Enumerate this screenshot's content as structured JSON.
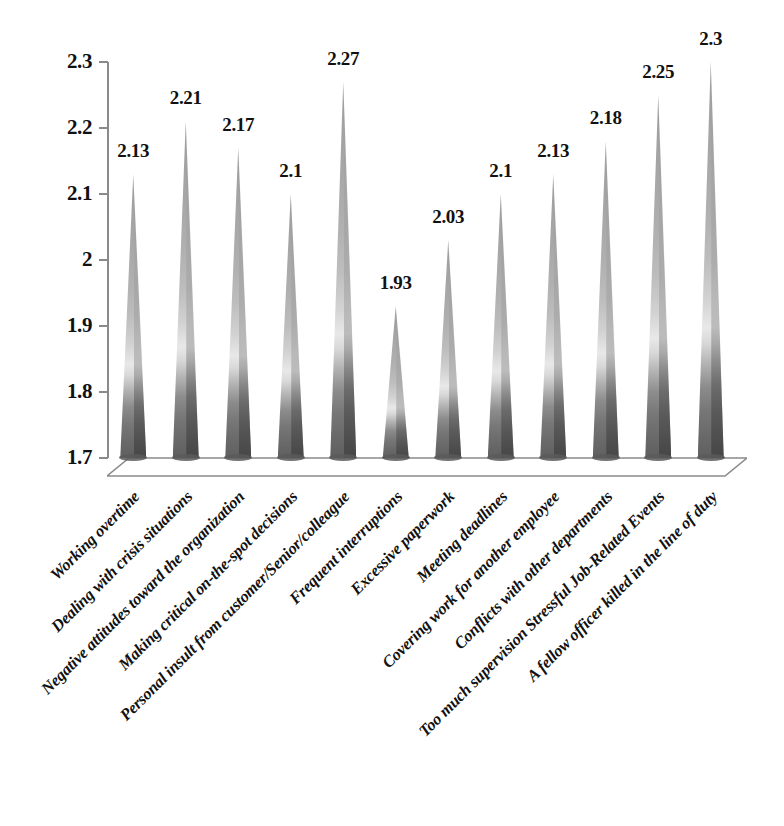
{
  "chart_data": {
    "type": "bar",
    "title": "",
    "subtitle": "",
    "xlabel": "",
    "ylabel": "",
    "ylim": [
      1.7,
      2.3
    ],
    "ytick_step": 0.1,
    "grid": false,
    "legend": "none",
    "bar_shape": "cone-3d",
    "categories": [
      "Working overtime",
      "Dealing with crisis situations",
      "Negative attitudes toward the organization",
      "Making critical on-the-spot decisions",
      "Personal insult from customer/Senior/colleague",
      "Frequent interruptions",
      "Excessive paperwork",
      "Meeting deadlines",
      "Covering work for another employee",
      "Conflicts with other departments",
      "Too much supervision Stressful Job-Related Events",
      "A fellow officer killed in the line of duty"
    ],
    "values": [
      2.13,
      2.21,
      2.17,
      2.1,
      2.27,
      1.93,
      2.03,
      2.1,
      2.13,
      2.18,
      2.25,
      2.3
    ],
    "value_labels": [
      "2.13",
      "2.21",
      "2.17",
      "2.1",
      "2.27",
      "1.93",
      "2.03",
      "2.1",
      "2.13",
      "2.18",
      "2.25",
      "2.3"
    ],
    "ytick_labels": [
      "2.3",
      "2.2",
      "2.1",
      "2",
      "1.9",
      "1.8",
      "1.7"
    ],
    "ytick_values": [
      2.3,
      2.2,
      2.1,
      2.0,
      1.9,
      1.8,
      1.7
    ],
    "colors": {
      "cone_base": "#5f5f5f",
      "cone_mid": "#e8e8e8",
      "cone_tip": "#9d9d9d",
      "axis": "#8a8a8a",
      "text": "#111111",
      "background": "#ffffff"
    }
  }
}
